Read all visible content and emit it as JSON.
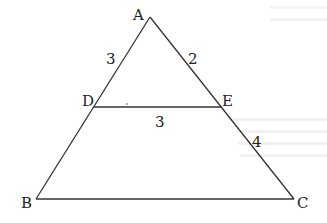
{
  "diagram": {
    "type": "triangle-with-parallel-segment",
    "points": {
      "A": {
        "label": "A",
        "x": 150,
        "y": 17
      },
      "B": {
        "label": "B",
        "x": 36,
        "y": 199
      },
      "C": {
        "label": "C",
        "x": 294,
        "y": 199
      },
      "D": {
        "label": "D",
        "x": 94,
        "y": 107
      },
      "E": {
        "label": "E",
        "x": 222,
        "y": 107
      }
    },
    "segments": [
      {
        "from": "A",
        "to": "B"
      },
      {
        "from": "A",
        "to": "C"
      },
      {
        "from": "B",
        "to": "C"
      },
      {
        "from": "D",
        "to": "E"
      }
    ],
    "lengths": {
      "AD": "3",
      "AE": "2",
      "DE": "3",
      "EC": "4"
    },
    "stroke_color": "#333333"
  }
}
